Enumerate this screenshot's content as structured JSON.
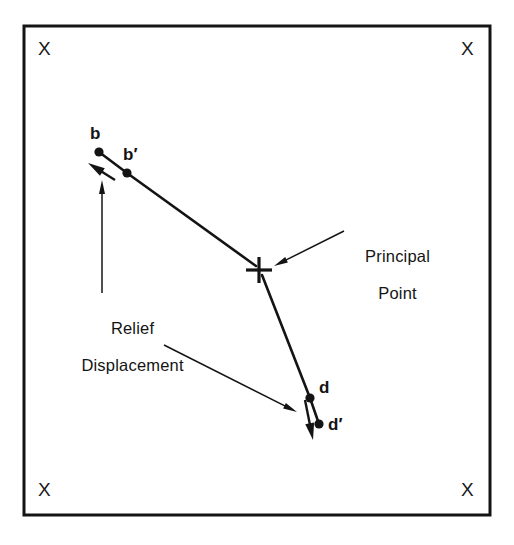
{
  "figure": {
    "background_color": "#ffffff",
    "ink_color": "#141414",
    "frame": {
      "name": "photo-frame",
      "x": 24,
      "y": 26,
      "width": 466,
      "height": 489,
      "stroke_width": 3
    },
    "fiducials": [
      {
        "id": "fiducial-top-left",
        "glyph": "X",
        "x": 38,
        "y": 38
      },
      {
        "id": "fiducial-top-right",
        "glyph": "X",
        "x": 461,
        "y": 38
      },
      {
        "id": "fiducial-bottom-left",
        "glyph": "X",
        "x": 38,
        "y": 479
      },
      {
        "id": "fiducial-bottom-right",
        "glyph": "X",
        "x": 461,
        "y": 479
      }
    ],
    "principal_point": {
      "name": "principal-point",
      "glyph": "+",
      "x": 259,
      "y": 270,
      "arm": 13,
      "stroke_width": 3.2
    },
    "points": [
      {
        "id": "point-b",
        "label": "b",
        "dot_x": 99,
        "dot_y": 152,
        "label_x": 90,
        "label_y": 124,
        "radius": 4.6
      },
      {
        "id": "point-b-prime",
        "label": "b′",
        "dot_x": 127,
        "dot_y": 173,
        "label_x": 123,
        "label_y": 145,
        "radius": 4.6
      },
      {
        "id": "point-d",
        "label": "d",
        "dot_x": 310,
        "dot_y": 398,
        "label_x": 319,
        "label_y": 378,
        "radius": 4.6
      },
      {
        "id": "point-d-prime",
        "label": "d′",
        "dot_x": 319,
        "dot_y": 424,
        "label_x": 328,
        "label_y": 415,
        "radius": 4.6
      }
    ],
    "radial_lines": [
      {
        "id": "radial-line-b-to-principal-point",
        "x1": 127,
        "y1": 173,
        "x2": 256,
        "y2": 266,
        "stroke_width": 2.6
      },
      {
        "id": "radial-line-principal-point-to-d",
        "x1": 262,
        "y1": 275,
        "x2": 310,
        "y2": 398,
        "stroke_width": 2.6
      },
      {
        "id": "segment-b-to-b-prime",
        "x1": 99,
        "y1": 152,
        "x2": 127,
        "y2": 173,
        "stroke_width": 2.6
      },
      {
        "id": "segment-d-to-d-prime",
        "x1": 310,
        "y1": 398,
        "x2": 319,
        "y2": 424,
        "stroke_width": 2.6
      }
    ],
    "displacement_vectors": [
      {
        "id": "displacement-vector-b",
        "description": "relief displacement at b, pointing outward away from principal point",
        "x1": 115,
        "y1": 180,
        "x2": 88,
        "y2": 163,
        "stroke_width": 2.4,
        "head_length": 17,
        "head_width": 9
      },
      {
        "id": "displacement-vector-d",
        "description": "relief displacement at d, pointing outward away from principal point",
        "x1": 305,
        "y1": 400,
        "x2": 313,
        "y2": 440,
        "stroke_width": 2.4,
        "head_length": 17,
        "head_width": 9
      }
    ],
    "annotations": [
      {
        "id": "annotation-principal-point",
        "line1": "Principal",
        "line2": "Point",
        "text_x": 388,
        "text_y": 228,
        "leader": {
          "id": "leader-principal-point",
          "x1": 344,
          "y1": 231,
          "x2": 274,
          "y2": 266,
          "stroke_width": 1.5,
          "head_length": 14,
          "head_width": 6
        }
      },
      {
        "id": "annotation-relief-displacement",
        "line1": "Relief",
        "line2": "Displacement",
        "text_x": 123,
        "text_y": 300,
        "leaders": [
          {
            "id": "leader-relief-displacement-to-b",
            "x1": 102,
            "y1": 293,
            "x2": 102,
            "y2": 180,
            "stroke_width": 1.5,
            "head_length": 14,
            "head_width": 6
          },
          {
            "id": "leader-relief-displacement-to-d",
            "x1": 164,
            "y1": 345,
            "x2": 297,
            "y2": 412,
            "stroke_width": 1.5,
            "head_length": 14,
            "head_width": 6
          }
        ]
      }
    ]
  }
}
